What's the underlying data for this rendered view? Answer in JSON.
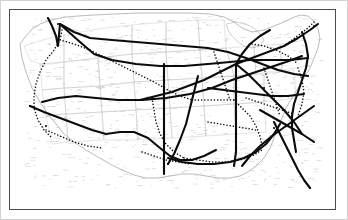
{
  "figure": {
    "kind": "scanned-map",
    "title": "United States route map",
    "background_color": "#ffffff",
    "outer_border_color": "#d2d2d2",
    "inner_frame_color": "#4b4b4b",
    "state_outline_color": "#b9b9b9",
    "coastline_color": "#9a9a9a",
    "route_solid_color": "#101010",
    "route_dotted_color": "#101010",
    "label_color": "#8d8d8d"
  },
  "legend": {
    "solid_route_label": "Primary route (solid heavy line)",
    "dotted_route_label": "Secondary route (dotted line)",
    "visible": false
  },
  "map_data": {
    "type": "network-map",
    "region": "Continental United States",
    "projection_note": "Unlabeled scanned lithograph; place names illegible at source resolution",
    "frame": {
      "x": 8,
      "y": 8,
      "width": 327,
      "height": 201
    },
    "national_outline": "M 18,42 L 24,34 L 30,27 L 38,22 L 46,19 L 54,17 L 64,15 L 76,14 L 92,13 L 112,12 L 136,11 L 162,11 L 188,11 L 208,12 L 222,15 L 232,20 L 240,26 L 250,30 L 262,28 L 272,24 L 282,20 L 290,16 L 298,13 L 306,14 L 312,19 L 316,27 L 318,36 L 316,46 L 312,56 L 308,66 L 302,76 L 296,86 L 290,96 L 284,106 L 280,116 L 276,126 L 272,136 L 268,146 L 262,156 L 254,164 L 246,170 L 238,174 L 228,176 L 216,176 L 204,174 L 192,172 L 180,172 L 168,174 L 156,176 L 144,176 L 132,173 L 120,168 L 108,162 L 96,155 L 84,148 L 72,140 L 62,132 L 54,122 L 46,112 L 38,100 L 30,86 L 24,70 L 20,56 Z",
    "state_lines": [
      "M 22,44 L 34,40 L 48,36 L 62,33 L 62,60 L 50,62 L 38,62 L 28,58 Z",
      "M 62,33 L 96,27 L 130,23 L 130,52 L 96,56 L 62,60 Z",
      "M 130,23 L 164,20 L 164,50 L 130,52 Z",
      "M 164,20 L 196,18 L 198,48 L 164,50 Z",
      "M 196,18 L 222,18 L 224,46 L 198,48 Z",
      "M 38,62 L 62,60 L 62,86 L 40,88 Z",
      "M 62,60 L 96,56 L 98,84 L 62,86 Z",
      "M 96,56 L 130,52 L 132,80 L 98,84 Z",
      "M 130,52 L 164,50 L 166,78 L 132,80 Z",
      "M 164,50 L 198,48 L 200,76 L 166,78 Z",
      "M 40,88 L 62,86 L 64,112 L 44,114 Z",
      "M 62,86 L 98,84 L 100,110 L 64,112 Z",
      "M 98,84 L 132,80 L 134,108 L 100,110 Z",
      "M 132,80 L 166,78 L 168,106 L 134,108 Z",
      "M 166,78 L 200,76 L 202,104 L 168,106 Z",
      "M 44,114 L 64,112 L 66,140 L 50,142 Z",
      "M 64,112 L 100,110 L 102,138 L 66,140 Z",
      "M 100,110 L 134,108 L 136,138 L 102,138 Z",
      "M 134,108 L 168,106 L 170,136 L 136,138 Z",
      "M 168,106 L 202,104 L 204,134 L 170,136 Z",
      "M 202,104 L 232,102 L 234,132 L 204,134 Z",
      "M 232,102 L 262,100 L 264,130 L 234,132 Z",
      "M 200,76 L 232,74 L 232,102 L 202,104 Z",
      "M 232,74 L 262,72 L 262,100 L 232,102 Z",
      "M 262,72 L 292,68 L 294,96 L 262,100 Z",
      "M 224,46 L 252,44 L 254,72 L 232,74 Z",
      "M 252,44 L 278,42 L 280,68 L 254,72 Z",
      "M 278,42 L 304,38 L 306,64 L 280,68 Z",
      "M 198,48 L 224,46 L 232,74 L 200,76 Z"
    ],
    "great_lakes_outline": "M 224,22 L 234,20 L 244,22 L 252,26 L 258,32 L 262,38 L 258,44 L 250,46 L 242,44 L 236,40 L 230,34 L 226,28 Z",
    "routes_solid": [
      {
        "name": "northern-transcontinental",
        "path": "M 58,22 L 72,30 L 88,36 L 110,38 L 134,40 L 158,42 L 182,44 L 206,46 L 226,50 L 244,56 L 260,62 L 276,68 L 292,72 L 306,74"
      },
      {
        "name": "northern-transcontinental-branch",
        "path": "M 60,24 L 78,40 L 92,52 L 110,58 L 134,62 L 158,64 L 182,64 L 206,62 L 228,60 L 248,58 L 268,58 L 288,58 L 306,56"
      },
      {
        "name": "pacific-northwest-coastal",
        "path": "M 46,16 L 50,24 L 54,34 L 56,44 L 58,22"
      },
      {
        "name": "central-overland",
        "path": "M 40,100 L 56,96 L 74,94 L 94,96 L 116,98 L 140,98 L 164,96 L 188,92 L 210,86 L 230,78 L 248,72 L 266,66 L 284,60 L 300,54"
      },
      {
        "name": "california-southwest",
        "path": "M 28,104 L 42,110 L 58,116 L 74,122 L 90,128 L 104,132 L 118,130 L 132,130 L 146,136 L 158,146 L 168,154 L 178,158 L 190,158 L 202,154 L 214,148"
      },
      {
        "name": "gulf-coast-route",
        "path": "M 166,156 L 180,160 L 196,162 L 212,162 L 228,160 L 242,156 L 254,150 L 264,142 L 272,132 L 278,122"
      },
      {
        "name": "chicago-gulf-trunk",
        "path": "M 234,62 L 234,78 L 234,96 L 234,114 L 234,132 L 234,150 L 232,164"
      },
      {
        "name": "mississippi-valley-trunk",
        "path": "M 162,62 L 162,82 L 162,102 L 162,122 L 162,142 L 162,160 L 162,172"
      },
      {
        "name": "chicago-southeast-diagonal",
        "path": "M 234,62 L 246,72 L 258,84 L 270,96 L 282,108 L 292,120 L 300,132"
      },
      {
        "name": "chicago-northeast-trunk",
        "path": "M 234,62 L 250,56 L 266,50 L 282,44 L 296,36 L 308,28 L 316,22"
      },
      {
        "name": "atlantic-seaboard",
        "path": "M 300,30 L 304,42 L 306,54 L 304,66 L 300,78 L 296,90 L 292,102 L 290,114 L 290,126 L 292,138 L 294,150"
      },
      {
        "name": "florida-peninsula-trunk",
        "path": "M 272,120 L 278,132 L 284,144 L 290,156 L 296,168 L 302,178 L 308,186"
      },
      {
        "name": "southeast-crossing",
        "path": "M 258,108 L 272,116 L 286,124 L 300,132 L 312,140"
      },
      {
        "name": "southeast-crossing-b",
        "path": "M 312,104 L 298,114 L 284,124 L 270,134 L 258,144 L 248,154 L 240,164"
      },
      {
        "name": "ohio-valley",
        "path": "M 206,86 L 222,88 L 238,90 L 254,92 L 270,94 L 286,94 L 302,92"
      },
      {
        "name": "chicago-kansas",
        "path": "M 234,62 L 218,70 L 202,78 L 186,84 L 170,90 L 154,94 L 138,98"
      },
      {
        "name": "texas-north-trunk",
        "path": "M 196,74 L 192,90 L 188,106 L 184,122 L 178,138 L 172,152 L 166,162"
      },
      {
        "name": "great-lakes-connector",
        "path": "M 234,62 L 240,52 L 248,42 L 258,34 L 268,28"
      }
    ],
    "routes_dotted": [
      {
        "name": "pacific-coast-dotted",
        "path": "M 60,28 L 58,38 L 52,48 L 44,58 L 38,70 L 34,82 L 32,94 L 32,106 L 36,118 L 42,128 L 50,136"
      },
      {
        "name": "northwest-interior-dotted",
        "path": "M 58,38 L 72,42 L 88,48 L 104,56 L 120,64 L 136,72 L 152,80 L 166,88 L 178,94 L 190,98"
      },
      {
        "name": "central-plains-dotted",
        "path": "M 190,98 L 204,98 L 218,98 L 232,98"
      },
      {
        "name": "kansas-dotted",
        "path": "M 150,96 L 152,108 L 154,120 L 158,132 L 164,142 L 172,150 L 182,156"
      },
      {
        "name": "gulf-dotted",
        "path": "M 182,156 L 196,158 L 210,160 L 224,160 L 238,158 L 250,154 L 260,148"
      },
      {
        "name": "southeast-dotted",
        "path": "M 232,98 L 240,106 L 248,114 L 254,124 L 258,134 L 260,144"
      },
      {
        "name": "appalachian-dotted",
        "path": "M 262,66 L 266,78 L 270,90 L 274,102 L 278,114"
      },
      {
        "name": "northeast-dotted",
        "path": "M 282,44 L 290,38 L 298,32 L 306,26 L 312,20"
      },
      {
        "name": "midwest-dotted",
        "path": "M 212,50 L 216,62 L 220,74 L 224,86 L 228,98"
      },
      {
        "name": "lakes-dotted",
        "path": "M 250,42 L 262,44 L 274,48 L 286,54 L 296,62"
      },
      {
        "name": "ohio-dotted",
        "path": "M 244,96 L 256,100 L 268,104 L 280,108 L 292,112"
      },
      {
        "name": "tennessee-dotted",
        "path": "M 206,120 L 218,122 L 230,124 L 242,126 L 254,128"
      },
      {
        "name": "atlantic-dotted",
        "path": "M 296,66 L 300,78 L 302,90 L 300,102 L 296,114"
      },
      {
        "name": "texas-gulf-dotted",
        "path": "M 140,150 L 152,154 L 164,158 L 176,160 L 188,162"
      },
      {
        "name": "southwest-dotted",
        "path": "M 44,128 L 58,134 L 72,140 L 86,144 L 100,146"
      }
    ],
    "hubs": [
      {
        "name": "northwest-terminal",
        "x": 56,
        "y": 22
      },
      {
        "name": "bay-terminal",
        "x": 28,
        "y": 104
      },
      {
        "name": "southwest-terminal",
        "x": 44,
        "y": 124
      },
      {
        "name": "plains-junction",
        "x": 150,
        "y": 96
      },
      {
        "name": "lakes-hub",
        "x": 234,
        "y": 62
      },
      {
        "name": "ohio-junction",
        "x": 262,
        "y": 86
      },
      {
        "name": "southeast-junction",
        "x": 272,
        "y": 126
      },
      {
        "name": "gulf-terminal",
        "x": 166,
        "y": 162
      },
      {
        "name": "atlantic-terminal",
        "x": 312,
        "y": 24
      },
      {
        "name": "florida-terminal",
        "x": 308,
        "y": 186
      }
    ],
    "place_labels_note": "Dozens of small italic place names printed in gray; individually illegible at 348x220"
  }
}
